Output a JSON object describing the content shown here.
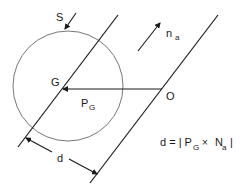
{
  "diagram": {
    "labels": {
      "S": "S",
      "G": "G",
      "O": "O",
      "P": "P",
      "P_sub": "G",
      "n": "n",
      "n_sub": "a",
      "d": "d"
    },
    "formula": {
      "lhs": "d = | P",
      "p_sub": "G",
      "times": "×",
      "N": "N",
      "n_sub": "a",
      "rhs": "|"
    },
    "colors": {
      "stroke": "#1a1a1a",
      "circle": "#555555",
      "background": "#ffffff"
    }
  }
}
